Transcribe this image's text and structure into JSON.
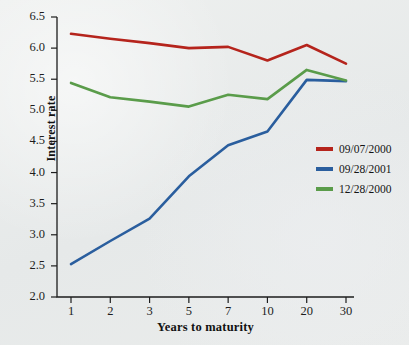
{
  "chart_data": {
    "type": "line",
    "title": "",
    "xlabel": "Years to maturity",
    "ylabel": "Interest rate",
    "categories": [
      "1",
      "2",
      "3",
      "5",
      "7",
      "10",
      "20",
      "30"
    ],
    "xticklabels": [
      "1",
      "2",
      "3",
      "5",
      "7",
      "10",
      "20",
      "30"
    ],
    "yticklabels": [
      "2.0",
      "2.5",
      "3.0",
      "3.5",
      "4.0",
      "4.5",
      "5.0",
      "5.5",
      "6.0",
      "6.5"
    ],
    "ylim": [
      2.0,
      6.5
    ],
    "ytick_step": 0.5,
    "grid": false,
    "legend_position": "center right",
    "series": [
      {
        "name": "09/07/2000",
        "color": "#b5241c",
        "values": [
          6.23,
          6.15,
          6.08,
          6.0,
          6.02,
          5.8,
          6.05,
          5.75
        ]
      },
      {
        "name": "09/28/2001",
        "color": "#2a5e9e",
        "values": [
          2.53,
          2.9,
          3.26,
          3.94,
          4.44,
          4.66,
          5.49,
          5.47
        ]
      },
      {
        "name": "12/28/2000",
        "color": "#5a9c4a",
        "values": [
          5.44,
          5.21,
          5.14,
          5.06,
          5.25,
          5.18,
          5.65,
          5.48
        ]
      }
    ]
  },
  "axes": {
    "y_title": "Interest rate",
    "x_title": "Years to maturity"
  },
  "legend": {
    "items": [
      {
        "label": "09/07/2000",
        "color": "#b5241c"
      },
      {
        "label": "09/28/2001",
        "color": "#2a5e9e"
      },
      {
        "label": "12/28/2000",
        "color": "#5a9c4a"
      }
    ]
  },
  "colors": {
    "background": "#e9ebea",
    "axis": "#1d1d1d",
    "series_red": "#b5241c",
    "series_blue": "#2a5e9e",
    "series_green": "#5a9c4a"
  }
}
